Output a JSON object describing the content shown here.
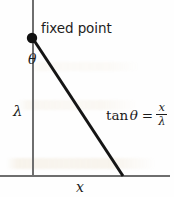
{
  "figure": {
    "kind": "geometry-diagram",
    "title_text": "",
    "background_color": "#fefefe",
    "width": 174,
    "height": 197
  },
  "labels": {
    "fixed_point": "fixed point",
    "angle": "θ",
    "vertical_side": "λ",
    "horizontal_side": "x"
  },
  "equation": {
    "function": "tan",
    "angle": "θ",
    "equals": "=",
    "numerator": "x",
    "denominator": "λ",
    "plain": "tan θ = x / λ"
  },
  "colors": {
    "axis_line": "#6e6e6e",
    "hypotenuse": "#151515",
    "point_marker": "#111111",
    "text": "#1b1b1b",
    "bleed_through": "#cbb078"
  },
  "geometry": {
    "vertical_axis": {
      "x": 33,
      "y_top": 0,
      "y_bottom": 176
    },
    "horizontal_axis": {
      "y": 176,
      "x_left": 0,
      "x_right": 170
    },
    "fixed_point_marker": {
      "cx": 32,
      "cy": 38,
      "r": 5
    },
    "hypotenuse": {
      "x1": 32,
      "y1": 38,
      "x2": 123,
      "y2": 176,
      "stroke_width": 3
    }
  }
}
